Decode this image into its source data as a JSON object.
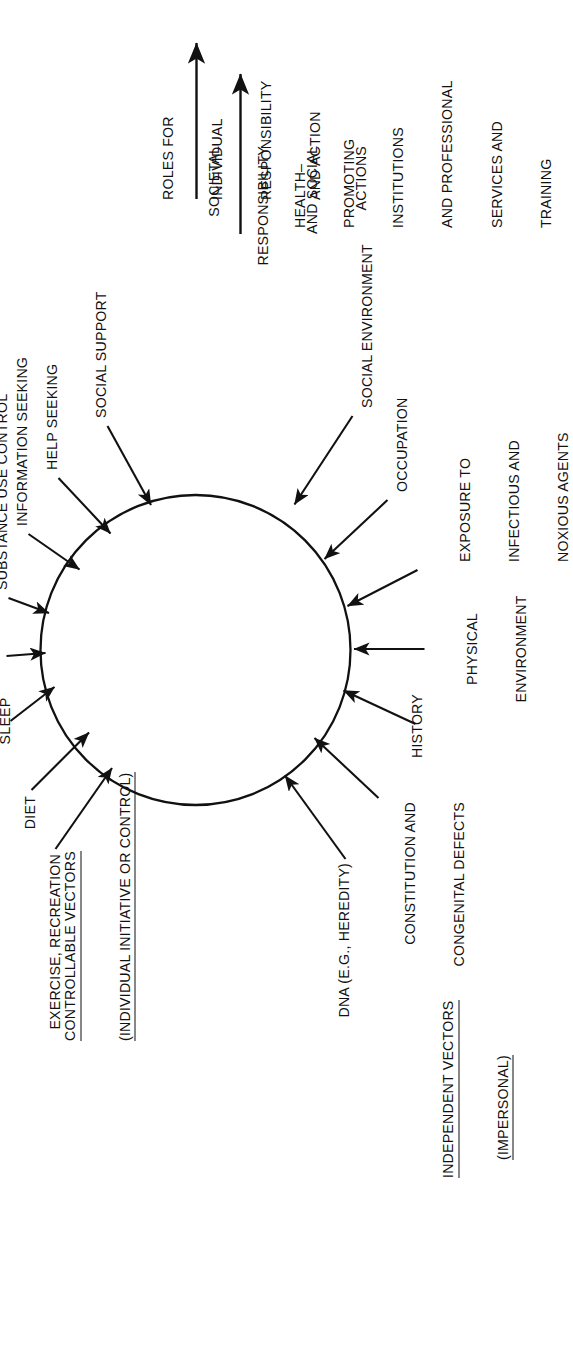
{
  "figure": {
    "circle": {
      "label": "",
      "cx": 696,
      "cy": 195,
      "r": 156
    }
  },
  "groups": {
    "controllable": {
      "heading_line1": "CONTROLLABLE VECTORS",
      "heading_line2": "(INDIVIDUAL INITIATIVE OR CONTROL)",
      "vectors": [
        {
          "label": "EXERCISE, RECREATION"
        },
        {
          "label": "DIET"
        },
        {
          "label": "SLEEP"
        },
        {
          "label": "STRESS REDUCTION"
        },
        {
          "label": "SUBSTANCE USE CONTROL"
        },
        {
          "label": "INFORMATION SEEKING"
        },
        {
          "label": "HELP SEEKING"
        },
        {
          "label": "SOCIAL SUPPORT"
        }
      ],
      "role_note": "ROLES FOR\nINDIVIDUAL\nRESPONSIBILITY\nAND ACTION",
      "role_note_lines": [
        "ROLES FOR",
        "INDIVIDUAL",
        "RESPONSIBILITY",
        "AND ACTION"
      ]
    },
    "independent": {
      "heading_line1": "INDEPENDENT VECTORS",
      "heading_line2": "(IMPERSONAL)",
      "vectors": [
        {
          "label": "DNA (E.G., HEREDITY)"
        },
        {
          "label": "CONSTITUTION AND\nCONGENITAL DEFECTS",
          "lines": [
            "CONSTITUTION AND",
            "CONGENITAL DEFECTS"
          ]
        },
        {
          "label": "HISTORY"
        },
        {
          "label": "PHYSICAL\nENVIRONMENT",
          "lines": [
            "PHYSICAL",
            "ENVIRONMENT"
          ]
        },
        {
          "label": "EXPOSURE TO\nINFECTIOUS AND\nNOXIOUS AGENTS",
          "lines": [
            "EXPOSURE TO",
            "INFECTIOUS AND",
            "NOXIOUS AGENTS"
          ]
        },
        {
          "label": "OCCUPATION"
        },
        {
          "label": "SOCIAL ENVIRONMENT"
        }
      ],
      "role_note_a_lines": [
        "SOCIETAL",
        "RESPONSIBILITY",
        "AND SOCIAL",
        "ACTIONS"
      ],
      "role_note_b_lines": [
        "HEALTH–",
        "PROMOTING",
        "INSTITUTIONS",
        "AND PROFESSIONAL",
        "SERVICES AND",
        "TRAINING"
      ]
    }
  },
  "colors": {
    "ink": "#111111",
    "paper": "#ffffff"
  },
  "icons": {
    "down_arrow": "down-arrow-icon",
    "vector_arrow": "vector-arrow-icon",
    "circle": "center-circle"
  }
}
